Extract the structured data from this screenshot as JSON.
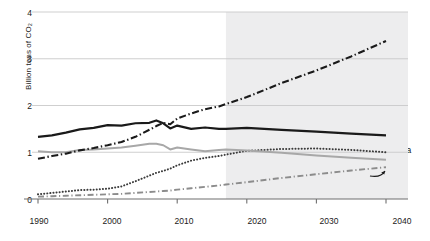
{
  "chart_data": {
    "type": "line",
    "title": "",
    "subtitle": "",
    "xlabel": "",
    "ylabel": "Billion tons of CO₂",
    "xlim": [
      1990,
      2040
    ],
    "ylim": [
      0,
      4
    ],
    "xticks": [
      1990,
      2000,
      2010,
      2020,
      2030,
      2040
    ],
    "yticks": [
      0,
      1,
      2,
      3,
      4
    ],
    "grid": "horizontal",
    "legend_position": "inline-annotations",
    "projection_start": 2017,
    "projection_shading": "#eceded",
    "annotations": [
      {
        "text": "Other low- and middle-income countries",
        "series": "other_low_middle_income"
      },
      {
        "text": "United States",
        "series": "united_states"
      },
      {
        "text": "China",
        "series": "china"
      },
      {
        "text": "EU",
        "series": "eu",
        "marker": "curved-arrow"
      },
      {
        "text": "India",
        "series": "india"
      }
    ],
    "x": [
      1990,
      1992,
      1994,
      1996,
      1998,
      2000,
      2002,
      2004,
      2006,
      2007,
      2008,
      2009,
      2010,
      2012,
      2014,
      2016,
      2017,
      2020,
      2025,
      2030,
      2035,
      2040
    ],
    "series": [
      {
        "name": "Other low- and middle-income countries",
        "key": "other_low_middle_income",
        "style": "dash-dot",
        "color": "#1a1a1a",
        "width": 2.1,
        "values": [
          0.86,
          0.92,
          0.97,
          1.04,
          1.09,
          1.15,
          1.22,
          1.33,
          1.48,
          1.56,
          1.63,
          1.6,
          1.72,
          1.83,
          1.92,
          1.98,
          2.03,
          2.18,
          2.48,
          2.75,
          3.05,
          3.38
        ]
      },
      {
        "name": "United States",
        "key": "united_states",
        "style": "solid",
        "color": "#1a1a1a",
        "width": 2.2,
        "values": [
          1.33,
          1.36,
          1.42,
          1.49,
          1.52,
          1.58,
          1.57,
          1.62,
          1.63,
          1.68,
          1.62,
          1.51,
          1.57,
          1.5,
          1.53,
          1.5,
          1.5,
          1.52,
          1.48,
          1.44,
          1.4,
          1.36
        ]
      },
      {
        "name": "EU",
        "key": "eu",
        "style": "solid",
        "color": "#a8a8a8",
        "width": 2.0,
        "values": [
          1.02,
          1.0,
          1.0,
          1.05,
          1.06,
          1.08,
          1.1,
          1.14,
          1.18,
          1.18,
          1.15,
          1.06,
          1.1,
          1.06,
          1.02,
          1.05,
          1.06,
          1.04,
          0.99,
          0.93,
          0.88,
          0.84
        ]
      },
      {
        "name": "China",
        "key": "china",
        "style": "dotted",
        "color": "#3a3a3a",
        "width": 2.0,
        "values": [
          0.1,
          0.13,
          0.16,
          0.19,
          0.2,
          0.22,
          0.27,
          0.38,
          0.5,
          0.56,
          0.6,
          0.65,
          0.72,
          0.82,
          0.88,
          0.92,
          0.95,
          1.03,
          1.07,
          1.08,
          1.05,
          1.0
        ]
      },
      {
        "name": "India",
        "key": "india",
        "style": "long-dash-dot",
        "color": "#8c8c8c",
        "width": 1.9,
        "values": [
          0.05,
          0.06,
          0.07,
          0.08,
          0.09,
          0.1,
          0.11,
          0.13,
          0.15,
          0.16,
          0.17,
          0.18,
          0.2,
          0.23,
          0.26,
          0.29,
          0.31,
          0.36,
          0.45,
          0.53,
          0.61,
          0.68
        ]
      }
    ]
  },
  "axis": {
    "y_ticks": [
      "0",
      "1",
      "2",
      "3",
      "4"
    ],
    "x_ticks": [
      "1990",
      "2000",
      "2010",
      "2020",
      "2030",
      "2040"
    ],
    "y_title": "Billion tons of CO₂"
  },
  "labels": {
    "other_line1": "Other low- and middle-",
    "other_line2": "income countries",
    "united": "United",
    "states": "States",
    "china": "China",
    "eu": "EU",
    "india": "India"
  },
  "colors": {
    "axis": "#6f6f6f",
    "grid": "#c9c9c9",
    "text": "#1a1a1a",
    "dark_line": "#1a1a1a",
    "gray_line": "#a8a8a8",
    "light_gray_line": "#8c8c8c",
    "shade": "#ededee"
  }
}
